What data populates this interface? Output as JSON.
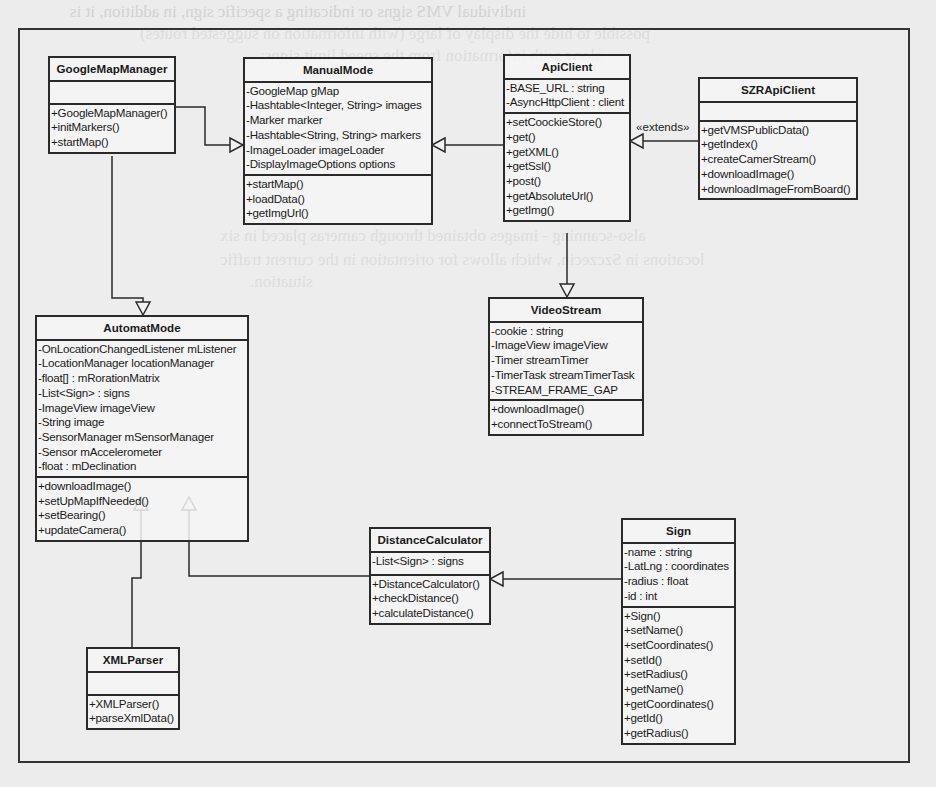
{
  "background_text": [
    "individual VMS signs or indicating a specific sign, in addition, it is",
    "possible to hide the display of large (with information on suggested routes)",
    "along with information from the speed limit signs;",
    "also-scanning - images obtained through cameras placed in six",
    "locations in Szczecin, which allows for orientation in the current traffic",
    "situation."
  ],
  "relationships": {
    "extends_label": "«extends»"
  },
  "classes": {
    "google_map_manager": {
      "name": "GoogleMapManager",
      "attributes": [],
      "methods": [
        "+GoogleMapManager()",
        "+initMarkers()",
        "+startMap()"
      ]
    },
    "manual_mode": {
      "name": "ManualMode",
      "attributes": [
        "-GoogleMap gMap",
        "-Hashtable<Integer, String> images",
        "-Marker marker",
        "-Hashtable<String, String> markers",
        "-ImageLoader imageLoader",
        "-DisplayImageOptions options"
      ],
      "methods": [
        "+startMap()",
        "+loadData()",
        "+getImgUrl()"
      ]
    },
    "api_client": {
      "name": "ApiClient",
      "attributes": [
        "-BASE_URL : string",
        "-AsyncHttpClient : client"
      ],
      "methods": [
        "+setCoockieStore()",
        "+get()",
        "+getXML()",
        "+getSsl()",
        "+post()",
        "+getAbsoluteUrl()",
        "+getImg()"
      ]
    },
    "szr_api_client": {
      "name": "SZRApiClient",
      "attributes": [],
      "methods": [
        "+getVMSPublicData()",
        "+getIndex()",
        "+createCamerStream()",
        "+downloadImage()",
        "+downloadImageFromBoard()"
      ]
    },
    "video_stream": {
      "name": "VideoStream",
      "attributes": [
        "-cookie : string",
        "-ImageView imageView",
        "-Timer streamTimer",
        "-TimerTask streamTimerTask",
        "-STREAM_FRAME_GAP"
      ],
      "methods": [
        "+downloadImage()",
        "+connectToStream()"
      ]
    },
    "automat_mode": {
      "name": "AutomatMode",
      "attributes": [
        "-OnLocationChangedListener mListener",
        "-LocationManager locationManager",
        "-float[] : mRorationMatrix",
        "-List<Sign> : signs",
        "-ImageView imageView",
        "-String image",
        "-SensorManager mSensorManager",
        "-Sensor mAccelerometer",
        "-float : mDeclination"
      ],
      "methods": [
        "+downloadImage()",
        "+setUpMapIfNeeded()",
        "+setBearing()",
        "+updateCamera()"
      ]
    },
    "distance_calculator": {
      "name": "DistanceCalculator",
      "attributes": [
        "-List<Sign> : signs"
      ],
      "methods": [
        "+DistanceCalculator()",
        "+checkDistance()",
        "+calculateDistance()"
      ]
    },
    "sign": {
      "name": "Sign",
      "attributes": [
        "-name : string",
        "-LatLng : coordinates",
        "-radius : float",
        "-id : int"
      ],
      "methods": [
        "+Sign()",
        "+setName()",
        "+setCoordinates()",
        "+setId()",
        "+setRadius()",
        "+getName()",
        "+getCoordinates()",
        "+getId()",
        "+getRadius()"
      ]
    },
    "xml_parser": {
      "name": "XMLParser",
      "attributes": [],
      "methods": [
        "+XMLParser()",
        "+parseXmlData()"
      ]
    }
  },
  "colors": {
    "line": "#2a2a2a",
    "paper": "#ececec",
    "box_fill": "#f4f4f4"
  }
}
